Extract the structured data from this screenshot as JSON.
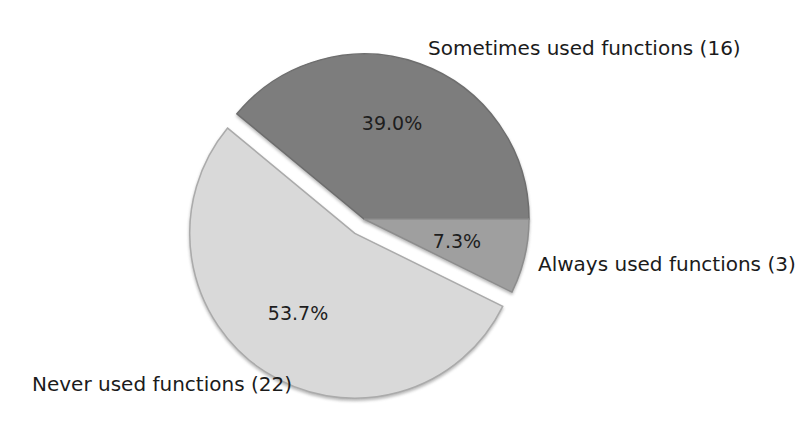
{
  "chart_data": {
    "type": "pie",
    "title": "",
    "start_angle_deg": 0,
    "direction": "counterclockwise",
    "background": "#ffffff",
    "text_color": "#1b1b1b",
    "slices": [
      {
        "label": "Sometimes used functions",
        "count": 16,
        "value_pct": 39.0,
        "pct_display": "39.0%",
        "label_display": "Sometimes used functions (16)",
        "color": "#7d7d7d",
        "edge": "#6e6e6e",
        "exploded": false
      },
      {
        "label": "Never used functions",
        "count": 22,
        "value_pct": 53.7,
        "pct_display": "53.7%",
        "label_display": "Never used functions (22)",
        "color": "#d9d9d9",
        "edge": "#ababab",
        "exploded": true
      },
      {
        "label": "Always used functions",
        "count": 3,
        "value_pct": 7.3,
        "pct_display": "7.3%",
        "label_display": "Always used functions (3)",
        "color": "#9f9f9f",
        "edge": "#8d8d8d",
        "exploded": false
      }
    ]
  }
}
